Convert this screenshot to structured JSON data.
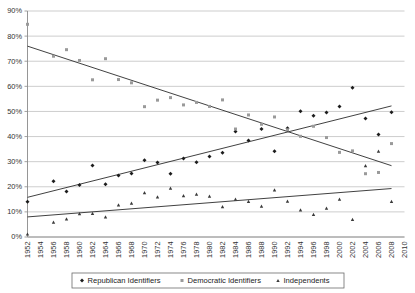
{
  "chart_data": {
    "type": "scatter",
    "title": "",
    "subtitle": "",
    "xlabel": "",
    "ylabel": "",
    "xlim": [
      1952,
      2010
    ],
    "ylim": [
      0,
      90
    ],
    "grid": true,
    "legend_position": "bottom",
    "y_ticks": [
      "0%",
      "10%",
      "20%",
      "30%",
      "40%",
      "50%",
      "60%",
      "70%",
      "80%",
      "90%"
    ],
    "y_tick_values": [
      0,
      10,
      20,
      30,
      40,
      50,
      60,
      70,
      80,
      90
    ],
    "x_ticks": [
      "1952",
      "1954",
      "1956",
      "1958",
      "1960",
      "1962",
      "1964",
      "1966",
      "1968",
      "1970",
      "1972",
      "1974",
      "1976",
      "1978",
      "1980",
      "1982",
      "1984",
      "1986",
      "1988",
      "1990",
      "1992",
      "1994",
      "1996",
      "1998",
      "2000",
      "2002",
      "2004",
      "2006",
      "2008",
      "2010"
    ],
    "x_tick_values": [
      1952,
      1954,
      1956,
      1958,
      1960,
      1962,
      1964,
      1966,
      1968,
      1970,
      1972,
      1974,
      1976,
      1978,
      1980,
      1982,
      1984,
      1986,
      1988,
      1990,
      1992,
      1994,
      1996,
      1998,
      2000,
      2002,
      2004,
      2006,
      2008,
      2010
    ],
    "series": [
      {
        "name": "Republican Identifiers",
        "marker": "diamond",
        "color": "#1c1c1c",
        "points": [
          {
            "x": 1952,
            "y": 14.0
          },
          {
            "x": 1956,
            "y": 22.2
          },
          {
            "x": 1958,
            "y": 18.1
          },
          {
            "x": 1960,
            "y": 20.7
          },
          {
            "x": 1962,
            "y": 28.5
          },
          {
            "x": 1964,
            "y": 21.0
          },
          {
            "x": 1966,
            "y": 24.5
          },
          {
            "x": 1968,
            "y": 25.3
          },
          {
            "x": 1970,
            "y": 30.6
          },
          {
            "x": 1972,
            "y": 29.7
          },
          {
            "x": 1974,
            "y": 25.2
          },
          {
            "x": 1976,
            "y": 31.3
          },
          {
            "x": 1978,
            "y": 29.8
          },
          {
            "x": 1980,
            "y": 32.1
          },
          {
            "x": 1982,
            "y": 33.6
          },
          {
            "x": 1984,
            "y": 42.0
          },
          {
            "x": 1986,
            "y": 38.4
          },
          {
            "x": 1988,
            "y": 43.0
          },
          {
            "x": 1990,
            "y": 34.1
          },
          {
            "x": 1992,
            "y": 43.3
          },
          {
            "x": 1994,
            "y": 50.1
          },
          {
            "x": 1996,
            "y": 48.3
          },
          {
            "x": 1998,
            "y": 49.6
          },
          {
            "x": 2000,
            "y": 52.0
          },
          {
            "x": 2002,
            "y": 59.4
          },
          {
            "x": 2004,
            "y": 47.2
          },
          {
            "x": 2006,
            "y": 40.8
          },
          {
            "x": 2008,
            "y": 49.7
          }
        ],
        "trend": {
          "x1": 1952,
          "y1": 15.8,
          "x2": 2008,
          "y2": 52.2
        }
      },
      {
        "name": "Democratic Identifiers",
        "marker": "square",
        "color": "#9a9a9a",
        "points": [
          {
            "x": 1952,
            "y": 84.7
          },
          {
            "x": 1956,
            "y": 72.0
          },
          {
            "x": 1958,
            "y": 74.6
          },
          {
            "x": 1960,
            "y": 70.3
          },
          {
            "x": 1962,
            "y": 62.6
          },
          {
            "x": 1964,
            "y": 71.0
          },
          {
            "x": 1966,
            "y": 62.7
          },
          {
            "x": 1968,
            "y": 61.4
          },
          {
            "x": 1970,
            "y": 51.9
          },
          {
            "x": 1972,
            "y": 54.5
          },
          {
            "x": 1974,
            "y": 55.5
          },
          {
            "x": 1976,
            "y": 52.6
          },
          {
            "x": 1978,
            "y": 53.6
          },
          {
            "x": 1980,
            "y": 52.0
          },
          {
            "x": 1982,
            "y": 54.6
          },
          {
            "x": 1984,
            "y": 43.0
          },
          {
            "x": 1986,
            "y": 48.6
          },
          {
            "x": 1988,
            "y": 44.9
          },
          {
            "x": 1990,
            "y": 47.8
          },
          {
            "x": 1992,
            "y": 42.7
          },
          {
            "x": 1994,
            "y": 40.1
          },
          {
            "x": 1996,
            "y": 44.1
          },
          {
            "x": 1998,
            "y": 39.6
          },
          {
            "x": 2000,
            "y": 33.7
          },
          {
            "x": 2002,
            "y": 34.3
          },
          {
            "x": 2004,
            "y": 25.2
          },
          {
            "x": 2006,
            "y": 25.7
          },
          {
            "x": 2008,
            "y": 37.2
          }
        ],
        "trend": {
          "x1": 1952,
          "y1": 76.0,
          "x2": 2008,
          "y2": 28.4
        }
      },
      {
        "name": "Independents",
        "marker": "triangle",
        "color": "#3a3a3a",
        "points": [
          {
            "x": 1952,
            "y": 1.2
          },
          {
            "x": 1956,
            "y": 5.9
          },
          {
            "x": 1958,
            "y": 7.2
          },
          {
            "x": 1960,
            "y": 9.3
          },
          {
            "x": 1962,
            "y": 9.4
          },
          {
            "x": 1964,
            "y": 8.0
          },
          {
            "x": 1966,
            "y": 12.8
          },
          {
            "x": 1968,
            "y": 13.5
          },
          {
            "x": 1970,
            "y": 17.7
          },
          {
            "x": 1972,
            "y": 16.0
          },
          {
            "x": 1974,
            "y": 19.5
          },
          {
            "x": 1976,
            "y": 16.5
          },
          {
            "x": 1978,
            "y": 17.1
          },
          {
            "x": 1980,
            "y": 16.3
          },
          {
            "x": 1982,
            "y": 12.1
          },
          {
            "x": 1984,
            "y": 15.1
          },
          {
            "x": 1986,
            "y": 14.2
          },
          {
            "x": 1988,
            "y": 12.3
          },
          {
            "x": 1990,
            "y": 18.8
          },
          {
            "x": 1992,
            "y": 14.3
          },
          {
            "x": 1994,
            "y": 10.8
          },
          {
            "x": 1996,
            "y": 9.0
          },
          {
            "x": 1998,
            "y": 11.5
          },
          {
            "x": 2000,
            "y": 15.1
          },
          {
            "x": 2002,
            "y": 7.0
          },
          {
            "x": 2004,
            "y": 28.4
          },
          {
            "x": 2006,
            "y": 34.2
          },
          {
            "x": 2008,
            "y": 14.2
          }
        ],
        "trend": {
          "x1": 1952,
          "y1": 8.0,
          "x2": 2008,
          "y2": 19.3
        }
      }
    ]
  },
  "legend": {
    "entries": [
      {
        "label": "Republican Identifiers",
        "marker": "diamond"
      },
      {
        "label": "Democratic Identifiers",
        "marker": "square"
      },
      {
        "label": "Independents",
        "marker": "triangle"
      }
    ]
  }
}
